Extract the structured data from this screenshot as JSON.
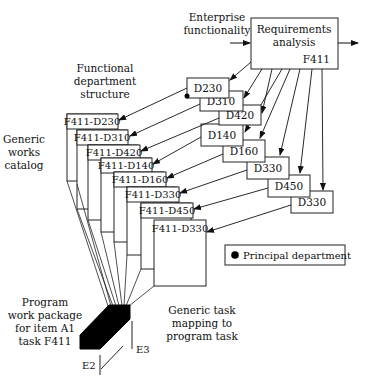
{
  "diagram": {
    "top_input": {
      "line1": "Enterprise",
      "line2": "functionality"
    },
    "requirements_box": {
      "line1": "Requirements",
      "line2": "analysis",
      "code": "F411"
    },
    "functional_structure_label": {
      "line1": "Functional",
      "line2": "department",
      "line3": "structure"
    },
    "catalog_label": {
      "line1": "Generic",
      "line2": "works",
      "line3": "catalog"
    },
    "departments": [
      {
        "label": "D230"
      },
      {
        "label": "D310"
      },
      {
        "label": "D420"
      },
      {
        "label": "D140"
      },
      {
        "label": "D160"
      },
      {
        "label": "D330"
      },
      {
        "label": "D450"
      },
      {
        "label": "D330"
      }
    ],
    "catalog_items": [
      {
        "label": "F411-D230"
      },
      {
        "label": "F411-D310"
      },
      {
        "label": "F411-D420"
      },
      {
        "label": "F411-D140"
      },
      {
        "label": "F411-D160"
      },
      {
        "label": "F411-D330"
      },
      {
        "label": "F411-D450"
      },
      {
        "label": "F411-D330"
      }
    ],
    "legend": {
      "label": "Principal department",
      "marker": "filled-circle"
    },
    "work_package_label": {
      "line1": "Program",
      "line2": "work package",
      "line3": "for item A1",
      "line4": "task F411"
    },
    "mapping_label": {
      "line1": "Generic task",
      "line2": "mapping to",
      "line3": "program task"
    },
    "axes": {
      "e2": "E2",
      "e3": "E3"
    },
    "colors": {
      "stroke": "#222222",
      "fill": "#000000",
      "background": "#ffffff"
    }
  }
}
